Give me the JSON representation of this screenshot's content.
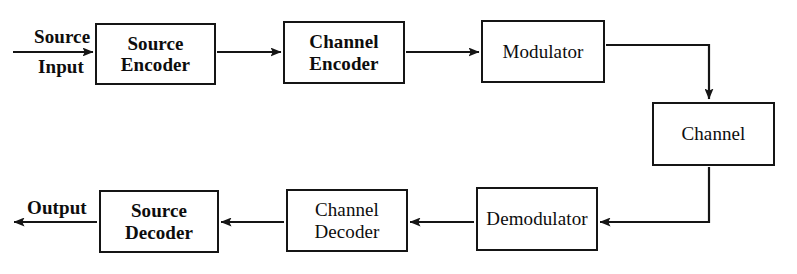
{
  "figure": {
    "kind": "block-diagram",
    "background_color": "#ffffff",
    "line_color": "#151515",
    "text_color": "#0d0d0d"
  },
  "blocks": [
    {
      "id": "source-encoder",
      "label": "Source\nEncoder",
      "bold": true,
      "x": 95,
      "y": 23,
      "w": 121,
      "h": 62
    },
    {
      "id": "channel-encoder",
      "label": "Channel\nEncoder",
      "bold": true,
      "x": 283,
      "y": 21,
      "w": 122,
      "h": 63
    },
    {
      "id": "modulator",
      "label": "Modulator",
      "bold": false,
      "x": 481,
      "y": 20,
      "w": 124,
      "h": 63
    },
    {
      "id": "channel",
      "label": "Channel",
      "bold": false,
      "x": 652,
      "y": 102,
      "w": 123,
      "h": 64
    },
    {
      "id": "demodulator",
      "label": "Demodulator",
      "bold": false,
      "x": 476,
      "y": 187,
      "w": 122,
      "h": 64
    },
    {
      "id": "channel-decoder",
      "label": "Channel\nDecoder",
      "bold": false,
      "x": 286,
      "y": 189,
      "w": 122,
      "h": 63
    },
    {
      "id": "source-decoder",
      "label": "Source\nDecoder",
      "bold": true,
      "x": 99,
      "y": 190,
      "w": 120,
      "h": 63
    }
  ],
  "edge_labels": [
    {
      "id": "source-input-top",
      "text": "Source",
      "bold": true,
      "x": 34,
      "y": 26
    },
    {
      "id": "source-input-bottom",
      "text": "Input",
      "bold": true,
      "x": 38,
      "y": 56
    },
    {
      "id": "output",
      "text": "Output",
      "bold": true,
      "x": 27,
      "y": 197
    }
  ],
  "connections": [
    {
      "id": "input-to-source-encoder",
      "from": "source-input",
      "to": "source-encoder",
      "type": "straight",
      "direction": "right"
    },
    {
      "id": "source-encoder-to-channel-encoder",
      "from": "source-encoder",
      "to": "channel-encoder",
      "type": "straight",
      "direction": "right"
    },
    {
      "id": "channel-encoder-to-modulator",
      "from": "channel-encoder",
      "to": "modulator",
      "type": "straight",
      "direction": "right"
    },
    {
      "id": "modulator-to-channel",
      "from": "modulator",
      "to": "channel",
      "type": "elbow",
      "direction": "down"
    },
    {
      "id": "channel-to-demodulator",
      "from": "channel",
      "to": "demodulator",
      "type": "elbow",
      "direction": "left"
    },
    {
      "id": "demodulator-to-channel-decoder",
      "from": "demodulator",
      "to": "channel-decoder",
      "type": "straight",
      "direction": "left"
    },
    {
      "id": "channel-decoder-to-source-decoder",
      "from": "channel-decoder",
      "to": "source-decoder",
      "type": "straight",
      "direction": "left"
    },
    {
      "id": "source-decoder-to-output",
      "from": "source-decoder",
      "to": "output",
      "type": "straight",
      "direction": "left"
    }
  ]
}
